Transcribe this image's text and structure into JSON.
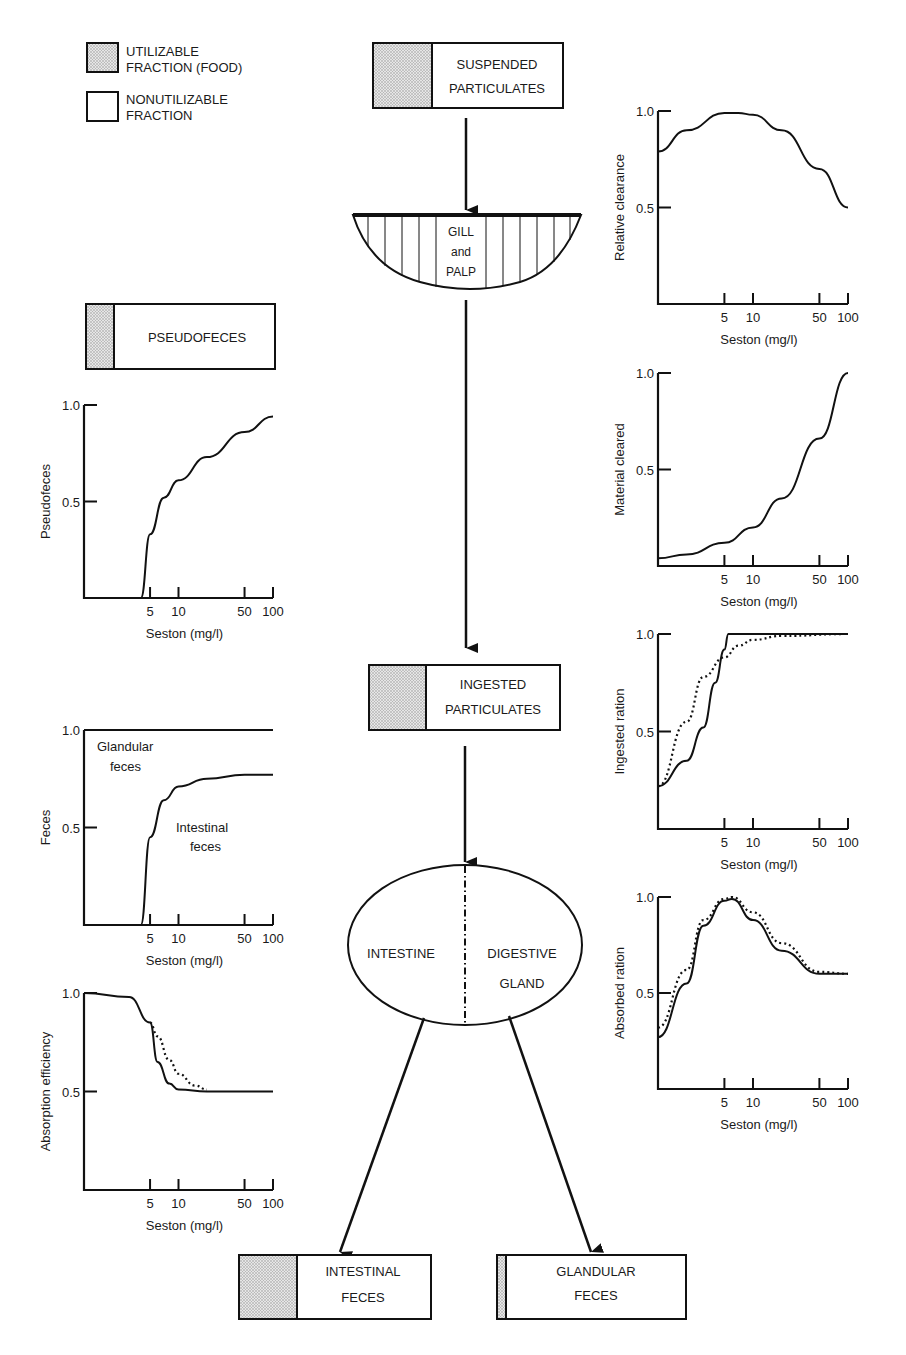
{
  "legend": {
    "utilizable": {
      "line1": "UTILIZABLE",
      "line2": "FRACTION (FOOD)"
    },
    "nonutilizable": {
      "line1": "NONUTILIZABLE",
      "line2": "FRACTION"
    }
  },
  "flow": {
    "suspended": {
      "line1": "SUSPENDED",
      "line2": "PARTICULATES"
    },
    "gill": {
      "line1": "GILL",
      "line2": "and",
      "line3": "PALP"
    },
    "pseudofeces": {
      "label": "PSEUDOFECES"
    },
    "ingested": {
      "line1": "INGESTED",
      "line2": "PARTICULATES"
    },
    "gut": {
      "left": "INTESTINE",
      "right1": "DIGESTIVE",
      "right2": "GLAND"
    },
    "intestinal_feces": {
      "line1": "INTESTINAL",
      "line2": "FECES"
    },
    "glandular_feces": {
      "line1": "GLANDULAR",
      "line2": "FECES"
    }
  },
  "axis": {
    "xlabel": "Seston (mg/l)",
    "xticks": [
      "5",
      "10",
      "50",
      "100"
    ],
    "yticks": [
      "1.0",
      "0.5"
    ]
  },
  "annotations": {
    "glandular1": "Glandular",
    "glandular2": "feces",
    "intestinal1": "Intestinal",
    "intestinal2": "feces"
  },
  "chart_data": [
    {
      "id": "relative_clearance",
      "type": "line",
      "ylabel": "Relative clearance",
      "xlabel": "Seston (mg/l)",
      "xscale": "log",
      "xticks": [
        5,
        10,
        50,
        100
      ],
      "ylim": [
        0,
        1
      ],
      "series": [
        {
          "name": "solid",
          "x": [
            1,
            2,
            5,
            7,
            10,
            20,
            50,
            100
          ],
          "y": [
            0.79,
            0.9,
            0.99,
            0.99,
            0.98,
            0.9,
            0.7,
            0.5
          ]
        }
      ]
    },
    {
      "id": "material_cleared",
      "type": "line",
      "ylabel": "Material cleared",
      "xlabel": "Seston (mg/l)",
      "xscale": "log",
      "xticks": [
        5,
        10,
        50,
        100
      ],
      "ylim": [
        0,
        1
      ],
      "series": [
        {
          "name": "solid",
          "x": [
            1,
            2,
            5,
            10,
            20,
            50,
            100
          ],
          "y": [
            0.04,
            0.06,
            0.12,
            0.2,
            0.35,
            0.66,
            1.0
          ]
        }
      ]
    },
    {
      "id": "ingested_ration",
      "type": "line",
      "ylabel": "Ingested ration",
      "xlabel": "Seston (mg/l)",
      "xscale": "log",
      "xticks": [
        5,
        10,
        50,
        100
      ],
      "ylim": [
        0,
        1
      ],
      "series": [
        {
          "name": "solid",
          "x": [
            1,
            2,
            3,
            4,
            5,
            5.5,
            10,
            100
          ],
          "y": [
            0.22,
            0.35,
            0.52,
            0.75,
            0.92,
            1.0,
            1.0,
            1.0
          ]
        },
        {
          "name": "dotted",
          "x": [
            1,
            2,
            3,
            5,
            7,
            10,
            20,
            100
          ],
          "y": [
            0.22,
            0.55,
            0.78,
            0.88,
            0.94,
            0.97,
            0.99,
            1.0
          ]
        }
      ]
    },
    {
      "id": "absorbed_ration",
      "type": "line",
      "ylabel": "Absorbed ration",
      "xlabel": "Seston (mg/l)",
      "xscale": "log",
      "xticks": [
        5,
        10,
        50,
        100
      ],
      "ylim": [
        0,
        1
      ],
      "series": [
        {
          "name": "solid",
          "x": [
            1,
            2,
            3,
            5,
            6,
            10,
            20,
            50,
            100
          ],
          "y": [
            0.27,
            0.55,
            0.85,
            0.98,
            0.99,
            0.88,
            0.72,
            0.6,
            0.6
          ]
        },
        {
          "name": "dotted",
          "x": [
            1,
            2,
            3,
            5,
            6,
            10,
            20,
            50,
            100
          ],
          "y": [
            0.32,
            0.62,
            0.88,
            0.99,
            1.0,
            0.92,
            0.76,
            0.61,
            0.6
          ]
        }
      ]
    },
    {
      "id": "pseudofeces",
      "type": "line",
      "ylabel": "Pseudofeces",
      "xlabel": "Seston (mg/l)",
      "xscale": "log",
      "xticks": [
        5,
        10,
        50,
        100
      ],
      "ylim": [
        0,
        1
      ],
      "series": [
        {
          "name": "solid",
          "x": [
            4,
            5,
            7,
            10,
            20,
            50,
            100
          ],
          "y": [
            0,
            0.33,
            0.52,
            0.61,
            0.73,
            0.86,
            0.94
          ]
        }
      ]
    },
    {
      "id": "feces",
      "type": "line",
      "ylabel": "Feces",
      "xlabel": "Seston (mg/l)",
      "xscale": "log",
      "xticks": [
        5,
        10,
        50,
        100
      ],
      "ylim": [
        0,
        1
      ],
      "series": [
        {
          "name": "glandular_feces",
          "x": [
            1,
            100
          ],
          "y": [
            1.0,
            1.0
          ]
        },
        {
          "name": "intestinal_feces",
          "x": [
            4,
            5,
            7,
            10,
            20,
            50,
            100
          ],
          "y": [
            0,
            0.45,
            0.64,
            0.71,
            0.75,
            0.77,
            0.77
          ]
        }
      ]
    },
    {
      "id": "absorption_efficiency",
      "type": "line",
      "ylabel": "Absorption efficiency",
      "xlabel": "Seston (mg/l)",
      "xscale": "log",
      "xticks": [
        5,
        10,
        50,
        100
      ],
      "ylim": [
        0,
        1
      ],
      "series": [
        {
          "name": "solid",
          "x": [
            1,
            3,
            5,
            6,
            8,
            10,
            20,
            50,
            100
          ],
          "y": [
            1.0,
            0.98,
            0.85,
            0.65,
            0.54,
            0.51,
            0.5,
            0.5,
            0.5
          ]
        },
        {
          "name": "dotted",
          "x": [
            5,
            6,
            8,
            10,
            15,
            20
          ],
          "y": [
            0.85,
            0.78,
            0.66,
            0.59,
            0.53,
            0.51
          ]
        }
      ]
    }
  ]
}
